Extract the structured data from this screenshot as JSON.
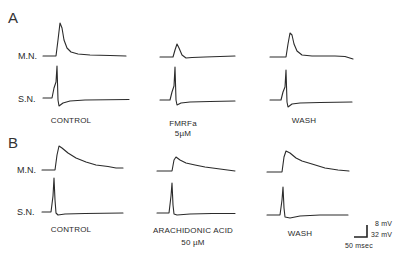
{
  "figure": {
    "panels": [
      {
        "letter": "A",
        "row_labels": [
          "M.N.",
          "S.N."
        ],
        "conditions": [
          {
            "label": "CONTROL",
            "sublabel": ""
          },
          {
            "label": "FMRFa",
            "sublabel": "5µM"
          },
          {
            "label": "WASH",
            "sublabel": ""
          }
        ]
      },
      {
        "letter": "B",
        "row_labels": [
          "M.N.",
          "S.N."
        ],
        "conditions": [
          {
            "label": "CONTROL",
            "sublabel": ""
          },
          {
            "label": "ARACHIDONIC ACID",
            "sublabel": "50 µM"
          },
          {
            "label": "WASH",
            "sublabel": ""
          }
        ]
      }
    ],
    "scale_bar": {
      "vertical_mn": "8  mV",
      "vertical_sn": "32  mV",
      "horizontal": "50 msec"
    },
    "trace_color": "#2b2b2b"
  }
}
